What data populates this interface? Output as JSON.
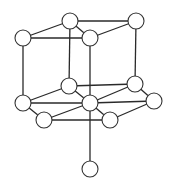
{
  "diagram": {
    "type": "crystal-lattice-structure",
    "colors": {
      "line": "#2a2a2a",
      "node_fill": "#ffffff",
      "node_stroke": "#333333",
      "background": "#ffffff"
    },
    "node_radius": 8,
    "nodes": [
      {
        "id": "top-back-left",
        "x": 70,
        "y": 21
      },
      {
        "id": "top-back-right",
        "x": 136,
        "y": 21
      },
      {
        "id": "top-front-left",
        "x": 23,
        "y": 38
      },
      {
        "id": "top-front-right",
        "x": 90,
        "y": 38
      },
      {
        "id": "mid-back-left",
        "x": 69,
        "y": 86
      },
      {
        "id": "mid-back-right",
        "x": 135,
        "y": 84
      },
      {
        "id": "mid-left",
        "x": 23,
        "y": 103
      },
      {
        "id": "mid-center",
        "x": 90,
        "y": 103
      },
      {
        "id": "mid-right",
        "x": 154,
        "y": 101
      },
      {
        "id": "low-front-left",
        "x": 44,
        "y": 120
      },
      {
        "id": "low-front-right",
        "x": 110,
        "y": 120
      },
      {
        "id": "bottom",
        "x": 90,
        "y": 169
      }
    ],
    "edges": [
      [
        "top-back-left",
        "top-back-right"
      ],
      [
        "top-back-left",
        "top-front-left"
      ],
      [
        "top-back-left",
        "top-front-right"
      ],
      [
        "top-front-left",
        "top-front-right"
      ],
      [
        "top-front-right",
        "top-back-right"
      ],
      [
        "top-back-left",
        "mid-back-left"
      ],
      [
        "top-back-right",
        "mid-back-right"
      ],
      [
        "top-front-left",
        "mid-left"
      ],
      [
        "top-front-right",
        "mid-center"
      ],
      [
        "mid-back-left",
        "mid-back-right"
      ],
      [
        "mid-back-left",
        "mid-left"
      ],
      [
        "mid-back-left",
        "mid-center"
      ],
      [
        "mid-back-right",
        "mid-center"
      ],
      [
        "mid-back-right",
        "mid-right"
      ],
      [
        "mid-left",
        "mid-center"
      ],
      [
        "mid-center",
        "mid-right"
      ],
      [
        "mid-left",
        "low-front-left"
      ],
      [
        "low-front-left",
        "mid-center"
      ],
      [
        "low-front-left",
        "low-front-right"
      ],
      [
        "low-front-right",
        "mid-right"
      ],
      [
        "mid-center",
        "low-front-right"
      ],
      [
        "mid-center",
        "bottom"
      ]
    ]
  }
}
